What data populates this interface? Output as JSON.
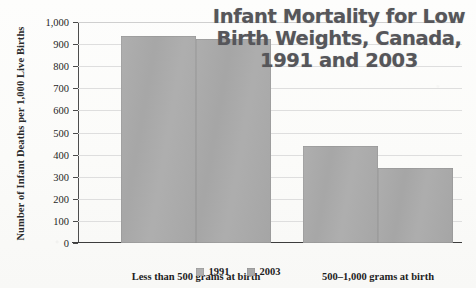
{
  "chart_data": {
    "type": "bar",
    "title": "Infant Mortality for Low\nBirth Weights, Canada,\n1991 and 2003",
    "title_lines": [
      "Infant Mortality for Low",
      "Birth Weights, Canada,",
      "1991 and 2003"
    ],
    "xlabel": "",
    "ylabel": "Number of Infant Deaths per 1,000 Live Births",
    "ylim": [
      0,
      1000
    ],
    "ytick_step": 100,
    "ytick_labels": [
      "1,000",
      "900",
      "800",
      "700",
      "600",
      "500",
      "400",
      "300",
      "200",
      "100",
      "0"
    ],
    "ytick_values": [
      1000,
      900,
      800,
      700,
      600,
      500,
      400,
      300,
      200,
      100,
      0
    ],
    "categories": [
      "Less than 500 grams at birth",
      "500–1,000 grams at birth"
    ],
    "series": [
      {
        "name": "1991",
        "values": [
          935,
          440
        ],
        "color": "#aaaaaa"
      },
      {
        "name": "2003",
        "values": [
          925,
          340
        ],
        "color": "#a9a9a9"
      }
    ],
    "legend": [
      "1991",
      "2003"
    ],
    "legend_position": "bottom-center",
    "grid": true,
    "grid_axis": "y",
    "bar_gap": 0
  },
  "colors": {
    "bar_1991": "#aaaaaa",
    "bar_2003": "#a9a9a9",
    "title": "#56565a",
    "axis": "#3d3d3d",
    "gridline": "#dedede",
    "text": "#1d1d1d",
    "background": "#fdfdfb"
  }
}
